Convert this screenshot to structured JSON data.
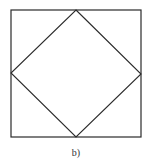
{
  "figure": {
    "caption": "b)",
    "stroke_color": "#2a2a2a",
    "outer_square": {
      "x": 11,
      "y": 10,
      "width": 130,
      "height": 127
    },
    "inner_diamond": {
      "points": [
        [
          76,
          10
        ],
        [
          141,
          74
        ],
        [
          76,
          137
        ],
        [
          11,
          73
        ]
      ]
    }
  }
}
